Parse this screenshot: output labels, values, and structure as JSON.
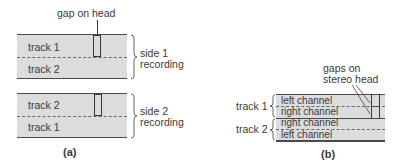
{
  "panel_a": {
    "caption": "(a)",
    "head_label": "gap on head",
    "tape_side1": {
      "upper_track": "track 1",
      "lower_track": "track 2",
      "brace_label_line1": "side 1",
      "brace_label_line2": "recording"
    },
    "tape_side2": {
      "upper_track": "track 2",
      "lower_track": "track 1",
      "brace_label_line1": "side 2",
      "brace_label_line2": "recording"
    }
  },
  "panel_b": {
    "caption": "(b)",
    "head_label_line1": "gaps on",
    "head_label_line2": "stereo head",
    "track1_label": "track 1",
    "track2_label": "track 2",
    "channels": [
      "left channel",
      "right channel",
      "right channel",
      "left channel"
    ]
  },
  "colors": {
    "tape_fill": "#dcdcdc",
    "line": "#4a4a4a",
    "text": "#3a3a3a"
  }
}
